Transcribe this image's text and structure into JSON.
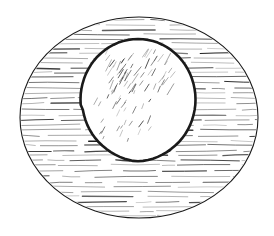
{
  "illustration": {
    "subject": "ellipse-with-inner-circle",
    "background": "#ffffff",
    "ink": "#1a1a1a",
    "outer_ellipse": {
      "cx": 139,
      "cy": 117.5,
      "rx": 119,
      "ry": 100.5,
      "stroke_width": 1.1
    },
    "inner_circle": {
      "cx": 138,
      "cy": 99.5,
      "rx": 57.5,
      "ry": 60.5,
      "stroke_width": 2.6,
      "fill": "#ffffff"
    },
    "hatching": {
      "orientation": "horizontal",
      "spacing_px": 5,
      "region": "outer-ellipse-minus-inner-circle"
    },
    "interior_strokes": {
      "orientation": "diagonal",
      "density": "light",
      "cluster": "upper"
    }
  }
}
